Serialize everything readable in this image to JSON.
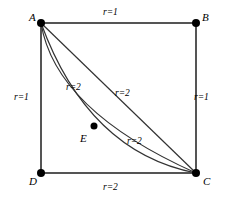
{
  "figure": {
    "type": "geometry-diagram",
    "stroke_color": "#333333",
    "edge_color": "#555555",
    "point_color": "#000000",
    "background": "#ffffff"
  },
  "vertices": [
    {
      "id": "A",
      "label": "A",
      "x": 41,
      "y": 23,
      "label_x": 29,
      "label_y": 12
    },
    {
      "id": "B",
      "label": "B",
      "x": 196,
      "y": 23,
      "label_x": 202,
      "label_y": 12
    },
    {
      "id": "C",
      "label": "C",
      "x": 196,
      "y": 173,
      "label_x": 203,
      "label_y": 176
    },
    {
      "id": "D",
      "label": "D",
      "x": 41,
      "y": 173,
      "label_x": 29,
      "label_y": 176
    },
    {
      "id": "E",
      "label": "E",
      "x": 94,
      "y": 126,
      "label_x": 80,
      "label_y": 133
    }
  ],
  "edges": [
    {
      "id": "AB",
      "from": "A",
      "to": "B"
    },
    {
      "id": "BC",
      "from": "B",
      "to": "C"
    },
    {
      "id": "DC",
      "from": "D",
      "to": "C"
    },
    {
      "id": "AD",
      "from": "A",
      "to": "D"
    }
  ],
  "diagonal": {
    "id": "AC",
    "from": "A",
    "to": "C"
  },
  "arcs": [
    {
      "id": "arc-A-E-C",
      "path": "M 41 23 Q 55 110 196 173",
      "description": "curve from A through E to C"
    },
    {
      "id": "arc-A-C-lower",
      "path": "M 41 23 Q 88 152 196 173",
      "description": "second curve from A to C"
    }
  ],
  "labels": {
    "top": {
      "text": "r=1",
      "r": "r",
      "eq": "=",
      "value": "1",
      "x": 103,
      "y": 8
    },
    "left": {
      "text": "r=1",
      "r": "r",
      "eq": "=",
      "value": "1",
      "x": 14,
      "y": 93
    },
    "right": {
      "text": "r=1",
      "r": "r",
      "eq": "=",
      "value": "1",
      "x": 194,
      "y": 93
    },
    "bottom": {
      "text": "r=2",
      "r": "r",
      "eq": "=",
      "value": "2",
      "x": 103,
      "y": 183
    },
    "inner_upper_left": {
      "text": "r=2",
      "r": "r",
      "eq": "=",
      "value": "2",
      "x": 66,
      "y": 83
    },
    "inner_diagonal": {
      "text": "r=2",
      "r": "r",
      "eq": "=",
      "value": "2",
      "x": 115,
      "y": 89
    },
    "inner_lower": {
      "text": "r=2",
      "r": "r",
      "eq": "=",
      "value": "2",
      "x": 127,
      "y": 137
    }
  }
}
